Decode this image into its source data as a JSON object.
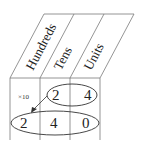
{
  "diagram": {
    "columns": [
      "Hundreds",
      "Tens",
      "Units"
    ],
    "row1": [
      "",
      "2",
      "4"
    ],
    "row2": [
      "2",
      "4",
      "0"
    ],
    "operation_label": "×10",
    "colors": {
      "lines": "#7a7a7a",
      "text": "#222222"
    }
  }
}
